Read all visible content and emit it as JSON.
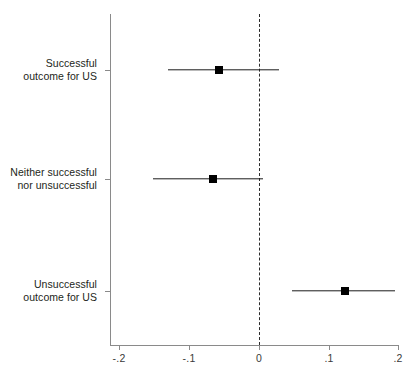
{
  "chart_data": {
    "type": "scatter",
    "subtype": "coefficient-plot-with-error-bars",
    "title": "",
    "subtitle": "",
    "xlabel": "",
    "ylabel": "",
    "xlim": [
      -0.2,
      0.2
    ],
    "ylim": [
      0,
      3
    ],
    "grid": false,
    "legend": false,
    "x_ticks": [
      -0.2,
      -0.1,
      0,
      0.1,
      0.2
    ],
    "x_tick_labels": [
      "-.2",
      "-.1",
      "0",
      ".1",
      ".2"
    ],
    "categories": [
      "Successful\noutcome for US",
      "Neither successful\nnor unsuccessful",
      "Unsuccessful\noutcome for US"
    ],
    "reference_line": {
      "value": 0,
      "orientation": "vertical",
      "style": "dashed",
      "color": "#2b2b2b"
    },
    "marker": {
      "shape": "square",
      "color": "#000000"
    },
    "points": [
      {
        "category": "Successful outcome for US",
        "estimate": -0.057,
        "ci_low": -0.13,
        "ci_high": 0.029,
        "crosses_zero": true
      },
      {
        "category": "Neither successful nor unsuccessful",
        "estimate": -0.066,
        "ci_low": -0.152,
        "ci_high": 0.006,
        "crosses_zero": true
      },
      {
        "category": "Unsuccessful outcome for US",
        "estimate": 0.123,
        "ci_low": 0.047,
        "ci_high": 0.195,
        "crosses_zero": false
      }
    ],
    "series": [
      {
        "name": "Estimate",
        "values": [
          -0.057,
          -0.066,
          0.123
        ]
      },
      {
        "name": "CI lower",
        "values": [
          -0.13,
          -0.152,
          0.047
        ]
      },
      {
        "name": "CI upper",
        "values": [
          0.029,
          0.006,
          0.195
        ]
      }
    ]
  },
  "axis": {
    "tick_labels": {
      "t0": "-.2",
      "t1": "-.1",
      "t2": "0",
      "t3": ".1",
      "t4": ".2"
    }
  },
  "categories": {
    "c0": "Successful\noutcome for US",
    "c1": "Neither successful\nnor unsuccessful",
    "c2": "Unsuccessful\noutcome for US"
  },
  "colors": {
    "axis": "#8a8a8a",
    "marker": "#000000",
    "whisker": "#1a1a1a",
    "reference": "#2b2b2b",
    "text": "#231f20",
    "background": "#ffffff"
  }
}
